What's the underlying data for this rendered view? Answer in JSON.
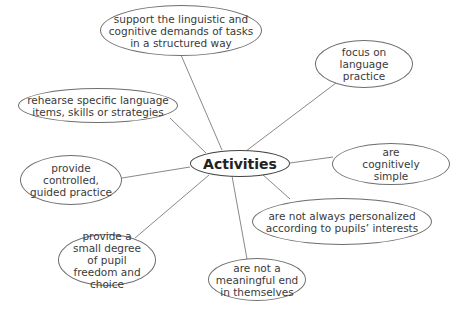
{
  "diagram": {
    "type": "mind-map",
    "center": {
      "label": "Activities"
    },
    "nodes": [
      {
        "id": "support",
        "label": "support the linguistic and cognitive demands of tasks in a structured way"
      },
      {
        "id": "focus",
        "label": "focus on language practice"
      },
      {
        "id": "rehearse",
        "label": "rehearse specific language items, skills or strategies"
      },
      {
        "id": "simple",
        "label": "are cognitively simple"
      },
      {
        "id": "controlled",
        "label": "provide controlled, guided practice"
      },
      {
        "id": "personalized",
        "label": "are not always personalized according to pupils’ interests"
      },
      {
        "id": "freedom",
        "label": "provide a small degree of pupil freedom and choice"
      },
      {
        "id": "meaningful",
        "label": "are not a meaningful end in themselves"
      }
    ],
    "edges": [
      [
        "Activities",
        "support"
      ],
      [
        "Activities",
        "focus"
      ],
      [
        "Activities",
        "rehearse"
      ],
      [
        "Activities",
        "simple"
      ],
      [
        "Activities",
        "controlled"
      ],
      [
        "Activities",
        "personalized"
      ],
      [
        "Activities",
        "freedom"
      ],
      [
        "Activities",
        "meaningful"
      ]
    ]
  }
}
